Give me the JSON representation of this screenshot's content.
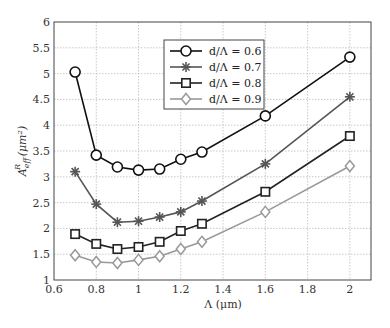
{
  "chart_data": {
    "type": "line",
    "title": "",
    "xlabel": "Λ (μm)",
    "ylabel_main": "A",
    "ylabel_sub": "eff",
    "ylabel_sup": "R",
    "ylabel_unit": "(μm²)",
    "xlim": [
      0.6,
      2.1
    ],
    "ylim": [
      1,
      6
    ],
    "xticks": [
      0.6,
      0.8,
      1,
      1.2,
      1.4,
      1.6,
      1.8,
      2
    ],
    "xtick_labels": [
      "0.6",
      "0.8",
      "1",
      "1.2",
      "1.4",
      "1.6",
      "1.8",
      "2"
    ],
    "yticks": [
      1,
      1.5,
      2,
      2.5,
      3,
      3.5,
      4,
      4.5,
      5,
      5.5,
      6
    ],
    "ytick_labels": [
      "1",
      "1.5",
      "2",
      "2.5",
      "3",
      "3.5",
      "4",
      "4.5",
      "5",
      "5.5",
      "6"
    ],
    "grid": true,
    "legend_position": "upper center",
    "x": [
      0.7,
      0.8,
      0.9,
      1.0,
      1.1,
      1.2,
      1.3,
      1.6,
      2.0
    ],
    "series": [
      {
        "name": "d/Λ = 0.6",
        "marker": "circle",
        "color": "#111111",
        "values": [
          5.03,
          3.42,
          3.19,
          3.13,
          3.15,
          3.34,
          3.48,
          4.18,
          5.32
        ]
      },
      {
        "name": "d/Λ = 0.7",
        "marker": "asterisk",
        "color": "#555555",
        "values": [
          3.1,
          2.47,
          2.12,
          2.14,
          2.22,
          2.32,
          2.53,
          3.25,
          4.55
        ]
      },
      {
        "name": "d/Λ = 0.8",
        "marker": "square",
        "color": "#222222",
        "values": [
          1.89,
          1.7,
          1.6,
          1.64,
          1.74,
          1.95,
          2.09,
          2.71,
          3.79
        ]
      },
      {
        "name": "d/Λ = 0.9",
        "marker": "diamond",
        "color": "#999999",
        "values": [
          1.48,
          1.35,
          1.33,
          1.39,
          1.46,
          1.6,
          1.74,
          2.32,
          3.21
        ]
      }
    ]
  }
}
